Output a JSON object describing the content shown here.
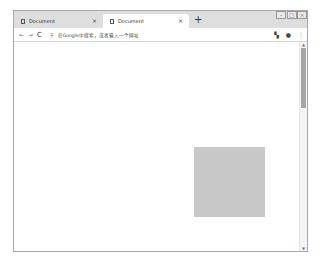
{
  "tabs": [
    {
      "title": "Document",
      "active": false,
      "close_label": "×"
    },
    {
      "title": "Document",
      "active": true,
      "close_label": "×"
    }
  ],
  "new_tab_label": "+",
  "window_controls": {
    "minimize": "–",
    "maximize": "□",
    "close": "×"
  },
  "toolbar": {
    "back_icon": "←",
    "forward_icon": "→",
    "reload_icon": "C",
    "search_icon": "⚲",
    "omnibox_placeholder": "在Google中搜索，或者输入一个网址",
    "extension_icon": "▚",
    "profile_icon": "●",
    "menu_icon": "⋮"
  },
  "page": {
    "box_color": "#c8c8c8"
  },
  "scrollbar": {
    "up_arrow": "▲",
    "down_arrow": "▼"
  }
}
